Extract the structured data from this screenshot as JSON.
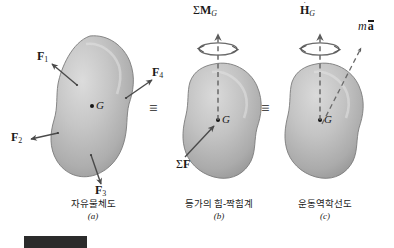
{
  "figure": {
    "title_banner_visible": true,
    "equivalence_symbol": "≡",
    "center_of_mass_label": "G"
  },
  "panels": [
    {
      "id": "a",
      "caption_ko": "자유물체도",
      "caption_index": "(a)",
      "body_label": "G",
      "forces": [
        {
          "name": "F1",
          "base": "F",
          "sub": "1"
        },
        {
          "name": "F2",
          "base": "F",
          "sub": "2"
        },
        {
          "name": "F3",
          "base": "F",
          "sub": "3"
        },
        {
          "name": "F4",
          "base": "F",
          "sub": "4"
        }
      ]
    },
    {
      "id": "b",
      "caption_ko": "등가의 힘-짝힘계",
      "caption_index": "(b)",
      "body_label": "G",
      "moment_label": {
        "sigma": "Σ",
        "base": "M",
        "sub": "G"
      },
      "force_label": {
        "sigma": "Σ",
        "base": "F"
      }
    },
    {
      "id": "c",
      "caption_ko": "운동역학선도",
      "caption_index": "(c)",
      "body_label": "G",
      "momentum_rate_label": {
        "base": "H",
        "sub": "G",
        "dot": "˙"
      },
      "inertia_label": {
        "mass": "m",
        "accel": "a",
        "bar": true
      }
    }
  ],
  "colors": {
    "body_fill_light": "#d6d6d6",
    "body_fill_mid": "#b9b9b9",
    "body_fill_dark": "#9a9a9a",
    "outline": "#7d7d7d",
    "arrow": "#4a4a4a",
    "text": "#1a1a1a",
    "banner": "#2b2b2b",
    "background": "#ffffff"
  }
}
